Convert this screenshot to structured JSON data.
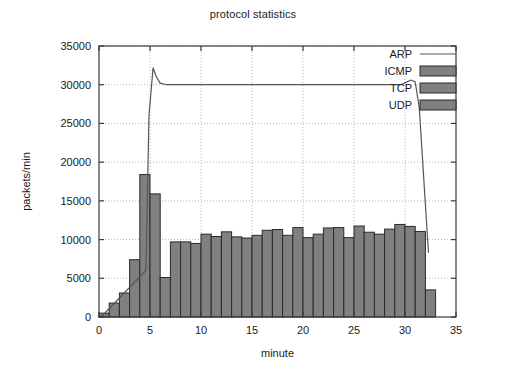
{
  "chart_data": {
    "type": "bar",
    "title": "protocol statistics",
    "xlabel": "minute",
    "ylabel": "packets/min",
    "xlim": [
      0,
      35
    ],
    "ylim": [
      0,
      35000
    ],
    "xticks": [
      0,
      5,
      10,
      15,
      20,
      25,
      30,
      35
    ],
    "yticks": [
      0,
      5000,
      10000,
      15000,
      20000,
      25000,
      30000,
      35000
    ],
    "grid": true,
    "legend_position": "top-right",
    "legend": [
      {
        "label": "ARP",
        "style": "line",
        "color": "#555555"
      },
      {
        "label": "ICMP",
        "style": "box",
        "color": "#808080"
      },
      {
        "label": "TCP",
        "style": "box",
        "color": "#808080"
      },
      {
        "label": "UDP",
        "style": "box",
        "color": "#808080"
      }
    ],
    "bar_color": "#808080",
    "bar_edge_color": "#2b2b2b",
    "line_color": "#555555",
    "categories": [
      0,
      1,
      2,
      3,
      4,
      5,
      6,
      7,
      8,
      9,
      10,
      11,
      12,
      13,
      14,
      15,
      16,
      17,
      18,
      19,
      20,
      21,
      22,
      23,
      24,
      25,
      26,
      27,
      28,
      29,
      30,
      31,
      32
    ],
    "series": [
      {
        "name": "packets",
        "type": "bar",
        "values": [
          500,
          1800,
          3100,
          7400,
          18400,
          15900,
          5100,
          9700,
          9700,
          9500,
          10700,
          10400,
          11000,
          10350,
          10200,
          10550,
          11200,
          11300,
          10550,
          11550,
          10250,
          10700,
          11500,
          11550,
          10250,
          11750,
          10950,
          10700,
          11350,
          11950,
          11700,
          11050,
          3500
        ]
      },
      {
        "name": "ARP",
        "type": "line",
        "x": [
          0.2,
          4.6,
          4.9,
          5.3,
          5.6,
          6.0,
          6.6,
          10,
          15,
          20,
          25,
          29.6,
          30.1,
          30.6,
          31.0,
          31.4,
          32.3
        ],
        "y": [
          0,
          6000,
          26000,
          32200,
          31100,
          30200,
          30000,
          30000,
          30000,
          30000,
          30000,
          30000,
          30300,
          30600,
          30350,
          27000,
          8300
        ]
      }
    ]
  }
}
